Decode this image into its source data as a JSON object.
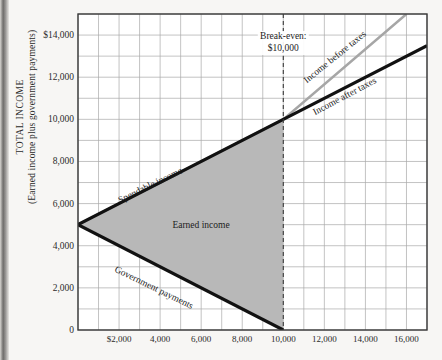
{
  "figure": {
    "background_color": "#f7f6f4",
    "plot_background_color": "#ffffff",
    "grid_color": "#a9a9a9",
    "frame_color": "#3a3a3a",
    "shade_color": "#b8b8b8",
    "line_black": "#111111",
    "line_gray": "#a6a6a6"
  },
  "axis": {
    "y_title_line1": "TOTAL INCOME",
    "y_title_line2": "(Earned income plus government payments)",
    "x_title": ""
  },
  "chart_data": {
    "type": "line",
    "title": "",
    "subtitle": "",
    "xlabel": "",
    "ylabel": "TOTAL INCOME (Earned income plus government payments)",
    "xlim": [
      0,
      17000
    ],
    "ylim": [
      0,
      15000
    ],
    "grid": true,
    "grid_step_x": 1000,
    "grid_step_y": 1000,
    "legend_position": "inline-labels",
    "xticks": [
      2000,
      4000,
      6000,
      8000,
      10000,
      12000,
      14000,
      16000
    ],
    "xticklabels": [
      "$2,000",
      "4,000",
      "6,000",
      "8,000",
      "10,000",
      "12,000",
      "14,000",
      "16,000"
    ],
    "yticks": [
      0,
      2000,
      4000,
      6000,
      8000,
      10000,
      12000,
      14000
    ],
    "yticklabels": [
      "0",
      "2,000",
      "4,000",
      "6,000",
      "8,000",
      "10,000",
      "12,000",
      "$14,000"
    ],
    "series": [
      {
        "name": "Income before taxes",
        "color": "#a6a6a6",
        "style": "solid",
        "width": 2.5,
        "points": [
          [
            0,
            5000
          ],
          [
            10000,
            10000
          ],
          [
            16000,
            15000
          ]
        ]
      },
      {
        "name": "Income after taxes",
        "color": "#111111",
        "style": "solid",
        "width": 3.2,
        "points": [
          [
            0,
            5000
          ],
          [
            10000,
            10000
          ],
          [
            17000,
            13500
          ]
        ]
      },
      {
        "name": "Government payments",
        "color": "#111111",
        "style": "solid",
        "width": 3.2,
        "points": [
          [
            0,
            5000
          ],
          [
            10000,
            0
          ]
        ]
      }
    ],
    "shaded_region": {
      "name": "Earned income",
      "color": "#b8b8b8",
      "polygon": [
        [
          0,
          5000
        ],
        [
          10000,
          10000
        ],
        [
          10000,
          0
        ]
      ]
    },
    "reference_line": {
      "name": "Break-even",
      "x": 10000,
      "style": "dashed",
      "color": "#3a3a3a"
    },
    "annotations": [
      {
        "id": "break-even",
        "line1": "Break-even:",
        "line2": "$10,000",
        "x": 10000,
        "y": 14200,
        "rotation": 0
      },
      {
        "id": "spendable-income",
        "text": "Spendable income",
        "x": 2100,
        "y": 6400,
        "rotation": -26
      },
      {
        "id": "earned-income",
        "text": "Earned income",
        "x": 4600,
        "y": 5000,
        "rotation": 0
      },
      {
        "id": "government-payments",
        "text": "Government payments",
        "x": 1700,
        "y": 3200,
        "rotation": 26
      },
      {
        "id": "income-before-taxes",
        "text": "Income before taxes",
        "x": 11200,
        "y": 12100,
        "rotation": -39
      },
      {
        "id": "income-after-taxes",
        "text": "Income after taxes",
        "x": 11600,
        "y": 10600,
        "rotation": -28
      }
    ]
  }
}
